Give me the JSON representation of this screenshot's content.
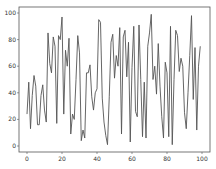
{
  "chart_data": {
    "type": "line",
    "title": "",
    "xlabel": "",
    "ylabel": "",
    "xlim": [
      -5,
      105
    ],
    "ylim": [
      -4,
      104
    ],
    "grid": false,
    "legend": null,
    "x_ticks": [
      0,
      20,
      40,
      60,
      80,
      100
    ],
    "y_ticks": [
      0,
      20,
      40,
      60,
      80,
      100
    ],
    "line_color": "#555555",
    "series": [
      {
        "name": "series",
        "x": [
          0,
          1,
          2,
          3,
          4,
          5,
          6,
          7,
          8,
          9,
          10,
          11,
          12,
          13,
          14,
          15,
          16,
          17,
          18,
          19,
          20,
          21,
          22,
          23,
          24,
          25,
          26,
          27,
          28,
          29,
          30,
          31,
          32,
          33,
          34,
          35,
          36,
          37,
          38,
          39,
          40,
          41,
          42,
          43,
          44,
          45,
          46,
          47,
          48,
          49,
          50,
          51,
          52,
          53,
          54,
          55,
          56,
          57,
          58,
          59,
          60,
          61,
          62,
          63,
          64,
          65,
          66,
          67,
          68,
          69,
          70,
          71,
          72,
          73,
          74,
          75,
          76,
          77,
          78,
          79,
          80,
          81,
          82,
          83,
          84,
          85,
          86,
          87,
          88,
          89,
          90,
          91,
          92,
          93,
          94,
          95,
          96,
          97,
          98,
          99
        ],
        "values": [
          24,
          48,
          13,
          38,
          53,
          45,
          16,
          16,
          38,
          46,
          27,
          18,
          85,
          62,
          55,
          82,
          75,
          17,
          83,
          80,
          97,
          24,
          72,
          60,
          81,
          9,
          24,
          20,
          50,
          83,
          70,
          4,
          12,
          6,
          55,
          55,
          61,
          37,
          27,
          40,
          43,
          95,
          93,
          36,
          18,
          8,
          1,
          37,
          78,
          84,
          51,
          68,
          60,
          89,
          9,
          82,
          87,
          52,
          78,
          3,
          59,
          90,
          26,
          22,
          91,
          50,
          7,
          48,
          6,
          75,
          85,
          99,
          50,
          60,
          39,
          77,
          45,
          22,
          6,
          63,
          55,
          7,
          90,
          1,
          50,
          87,
          83,
          56,
          66,
          60,
          25,
          13,
          40,
          68,
          98,
          35,
          74,
          12,
          60,
          75
        ]
      }
    ]
  }
}
